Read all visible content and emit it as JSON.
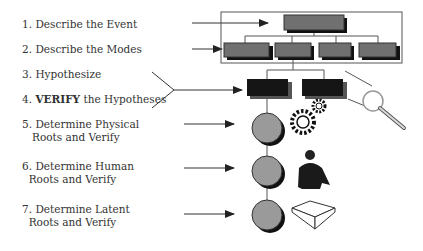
{
  "steps": [
    {
      "number": "1.",
      "text": "Describe the Event"
    },
    {
      "number": "2.",
      "text": "Describe the Modes"
    },
    {
      "number": "3.",
      "text": "Hypothesize"
    },
    {
      "number": "4.",
      "bold": "VERIFY",
      "text": " the Hypotheses"
    },
    {
      "number": "5.",
      "text": "Determine Physical",
      "line2": "Roots and Verify"
    },
    {
      "number": "6.",
      "text": "Determine Human",
      "line2": "Roots and Verify"
    },
    {
      "number": "7.",
      "text": "Determine Latent",
      "line2": "Roots and Verify"
    }
  ],
  "colors": {
    "box_top": "#6e6e6e",
    "box_dark": "#1a1a1a",
    "circle": "#9a9a9a",
    "line": "#333333"
  }
}
